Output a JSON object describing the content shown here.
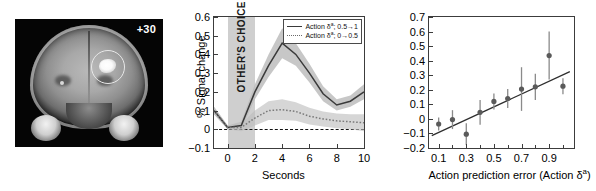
{
  "figure": {
    "panels": [
      "brain-slice",
      "timecourse",
      "regression"
    ]
  },
  "panel_a": {
    "name": "brain-slice-image",
    "slice_label": "+30",
    "roi_marker": "circle-highlight"
  },
  "chart_data": [
    {
      "id": "timecourse",
      "type": "line",
      "title": "",
      "xlabel": "Seconds",
      "ylabel": "% Signal change",
      "xlim": [
        -1,
        10
      ],
      "ylim": [
        -0.1,
        0.6
      ],
      "xticks": [
        0,
        2,
        4,
        6,
        8,
        10
      ],
      "xticklabels": [
        "0",
        "2",
        "4",
        "6",
        "8",
        "10"
      ],
      "yticks": [
        -0.1,
        0,
        0.1,
        0.2,
        0.3,
        0.4,
        0.5,
        0.6
      ],
      "yticklabels": [
        "−0.1",
        "0",
        "0.1",
        "0.2",
        "0.3",
        "0.4",
        "0.5",
        "0.6"
      ],
      "grid": false,
      "legend_position": "top-right",
      "zero_reference_line": 0,
      "shaded_region": {
        "label": "OTHER'S CHOICE",
        "x_start": 0,
        "x_end": 2,
        "color": "#cfcfcf"
      },
      "x": [
        -1,
        0,
        1,
        2,
        3,
        4,
        5,
        6,
        7,
        8,
        9,
        10
      ],
      "series": [
        {
          "name": "Action δᵃ; 0.5→1",
          "style": "solid",
          "color": "#3a3a3a",
          "values": [
            0.1,
            0.01,
            0.02,
            0.2,
            0.34,
            0.46,
            0.4,
            0.3,
            0.19,
            0.13,
            0.15,
            0.2
          ],
          "error": [
            0.02,
            0.01,
            0.02,
            0.04,
            0.06,
            0.08,
            0.06,
            0.05,
            0.04,
            0.03,
            0.03,
            0.04
          ]
        },
        {
          "name": "Action δᵃ; 0→0.5",
          "style": "dotted",
          "color": "#7a7a7a",
          "values": [
            0.1,
            0.01,
            0.01,
            0.06,
            0.1,
            0.105,
            0.095,
            0.07,
            0.055,
            0.045,
            0.04,
            0.035
          ],
          "error": [
            0.02,
            0.01,
            0.02,
            0.04,
            0.05,
            0.055,
            0.05,
            0.045,
            0.04,
            0.04,
            0.04,
            0.045
          ]
        }
      ]
    },
    {
      "id": "regression",
      "type": "scatter",
      "title": "",
      "xlabel": "Action prediction error (Action δᵃ)",
      "ylabel": "",
      "xlim": [
        0.03,
        1.08
      ],
      "ylim": [
        -0.2,
        0.7
      ],
      "xticks": [
        0.1,
        0.3,
        0.5,
        0.7,
        0.9
      ],
      "xticklabels": [
        "0.1",
        "0.3",
        "0.5",
        "0.7",
        "0.9"
      ],
      "yticks": [
        -0.2,
        -0.1,
        0,
        0.1,
        0.2,
        0.3,
        0.4,
        0.5,
        0.6,
        0.7
      ],
      "yticklabels": [
        "−0.2",
        "−0.1",
        "0",
        "0.1",
        "0.2",
        "0.3",
        "0.4",
        "0.5",
        "0.6",
        "0.7"
      ],
      "grid": false,
      "marker_color": "#5a5a5a",
      "x": [
        0.1,
        0.2,
        0.3,
        0.4,
        0.5,
        0.6,
        0.7,
        0.8,
        0.9,
        1.0
      ],
      "values": [
        -0.035,
        -0.005,
        -0.105,
        0.045,
        0.12,
        0.14,
        0.205,
        0.22,
        0.435,
        0.225
      ],
      "error": [
        0.045,
        0.065,
        0.075,
        0.085,
        0.055,
        0.065,
        0.15,
        0.09,
        0.165,
        0.055
      ],
      "fit_line": {
        "type": "linear",
        "x_start": 0.05,
        "y_start": -0.115,
        "x_end": 1.05,
        "y_end": 0.325
      }
    }
  ]
}
